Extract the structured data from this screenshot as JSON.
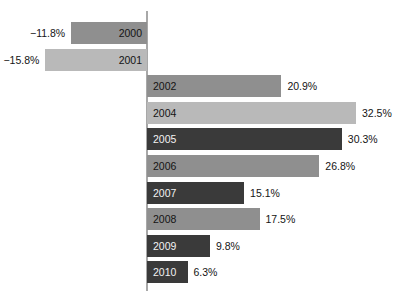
{
  "chart_data": {
    "type": "bar",
    "orientation": "horizontal",
    "title": "",
    "xlabel": "",
    "ylabel": "",
    "categories": [
      "2000",
      "2001",
      "2002",
      "2004",
      "2005",
      "2006",
      "2007",
      "2008",
      "2009",
      "2010"
    ],
    "values": [
      -11.8,
      -15.8,
      20.9,
      32.5,
      30.3,
      26.8,
      15.1,
      17.5,
      9.8,
      6.3
    ],
    "value_labels": [
      "−11.8%",
      "−15.8%",
      "20.9%",
      "32.5%",
      "30.3%",
      "26.8%",
      "15.1%",
      "17.5%",
      "9.8%",
      "6.3%"
    ],
    "xlim": [
      -15.8,
      32.5
    ],
    "grid": false,
    "legend": "none",
    "zero_axis": true,
    "bar_colors": [
      "#8f8f8f",
      "#b9b9b9",
      "#8f8f8f",
      "#b9b9b9",
      "#3a3a3a",
      "#8f8f8f",
      "#3a3a3a",
      "#8f8f8f",
      "#3a3a3a",
      "#3a3a3a"
    ]
  },
  "colors": {
    "dark_gray": "#3a3a3a",
    "mid_gray": "#8f8f8f",
    "light_gray": "#b9b9b9",
    "axis_gray": "#a8a8a8",
    "background": "#ffffff",
    "text": "#141414",
    "text_on_dark": "#f2f2f2"
  },
  "axis": {
    "zero_label": "0"
  },
  "bars": [
    {
      "year": "2000",
      "value": -11.8,
      "label": "−11.8%",
      "tone": "mid",
      "sign": "neg"
    },
    {
      "year": "2001",
      "value": -15.8,
      "label": "−15.8%",
      "tone": "light",
      "sign": "neg"
    },
    {
      "year": "2002",
      "value": 20.9,
      "label": "20.9%",
      "tone": "mid",
      "sign": "pos"
    },
    {
      "year": "2004",
      "value": 32.5,
      "label": "32.5%",
      "tone": "light",
      "sign": "pos"
    },
    {
      "year": "2005",
      "value": 30.3,
      "label": "30.3%",
      "tone": "dark",
      "sign": "pos"
    },
    {
      "year": "2006",
      "value": 26.8,
      "label": "26.8%",
      "tone": "mid",
      "sign": "pos"
    },
    {
      "year": "2007",
      "value": 15.1,
      "label": "15.1%",
      "tone": "dark",
      "sign": "pos"
    },
    {
      "year": "2008",
      "value": 17.5,
      "label": "17.5%",
      "tone": "mid",
      "sign": "pos"
    },
    {
      "year": "2009",
      "value": 9.8,
      "label": "9.8%",
      "tone": "dark",
      "sign": "pos"
    },
    {
      "year": "2010",
      "value": 6.3,
      "label": "6.3%",
      "tone": "dark",
      "sign": "pos"
    }
  ]
}
